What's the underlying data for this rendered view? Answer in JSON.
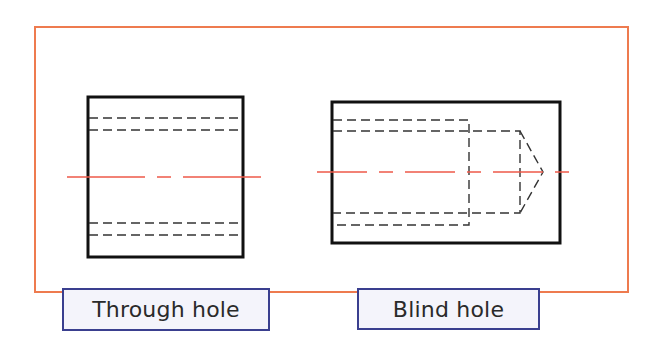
{
  "diagram": {
    "type": "technical-drawing",
    "colors": {
      "frame": "#ee7b4f",
      "centerline": "#ee5a4a",
      "outline": "#111111",
      "hidden_line": "#333333",
      "label_border": "#3a3f8f",
      "label_fill": "#f4f4fb"
    },
    "views": [
      {
        "id": "through-hole",
        "label": "Through hole",
        "description": "Rectangular section with a hole passing completely through (hidden lines span the full width)"
      },
      {
        "id": "blind-hole",
        "label": "Blind hole",
        "description": "Rectangular section with a counterbore and a drilled hole ending in a conical tip (hidden lines stop inside the part)"
      }
    ]
  }
}
